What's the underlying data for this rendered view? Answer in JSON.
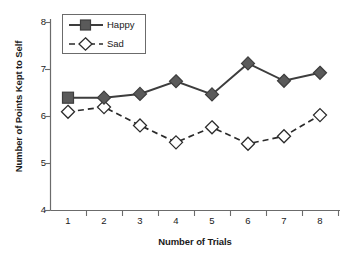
{
  "chart_data": {
    "type": "line",
    "title": "",
    "xlabel": "Number of Trials",
    "ylabel": "Number of Points Kept to Self",
    "categories": [
      "1",
      "2",
      "3",
      "4",
      "5",
      "6",
      "7",
      "8"
    ],
    "x": [
      1,
      2,
      3,
      4,
      5,
      6,
      7,
      8
    ],
    "xlim": [
      0.5,
      8.5
    ],
    "ylim": [
      4,
      8
    ],
    "yticks": [
      "4",
      "5",
      "6",
      "7",
      "8"
    ],
    "grid": false,
    "legend_position": "top-left",
    "series": [
      {
        "name": "Happy",
        "values": [
          6.4,
          6.4,
          6.48,
          6.75,
          6.47,
          7.13,
          6.76,
          6.93
        ],
        "line_style": "solid",
        "marker": "filled-diamond",
        "first_marker": "filled-square",
        "color": "#4d4d4d"
      },
      {
        "name": "Sad",
        "values": [
          6.1,
          6.2,
          5.81,
          5.45,
          5.77,
          5.42,
          5.58,
          6.03
        ],
        "line_style": "dashed",
        "marker": "open-diamond",
        "color": "#333333"
      }
    ]
  },
  "legend": {
    "items": [
      {
        "label": "Happy"
      },
      {
        "label": "Sad"
      }
    ]
  },
  "axes": {
    "y_title": "Number of Points Kept to Self",
    "x_title": "Number of Trials",
    "y_tick_labels": [
      "8",
      "7",
      "6",
      "5",
      "4"
    ],
    "x_tick_labels": [
      "1",
      "2",
      "3",
      "4",
      "5",
      "6",
      "7",
      "8"
    ]
  },
  "colors": {
    "axis": "#6b6b6b",
    "happy_marker_fill": "#5a5a5a",
    "happy_line": "#3d3d3d",
    "sad_marker_fill": "#ffffff",
    "sad_line": "#2b2b2b",
    "text": "#1a1a1a"
  }
}
